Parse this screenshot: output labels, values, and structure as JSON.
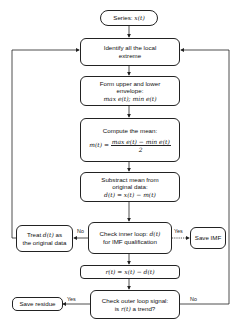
{
  "diagram": {
    "nodes": {
      "series": {
        "label": "Series: ",
        "math": "x(t)"
      },
      "identify": {
        "line1": "Identify all the local",
        "line2": "extreme"
      },
      "envelope": {
        "line1": "Form upper and lower",
        "line2": "envelope:",
        "math": "max e(t);  min e(t)"
      },
      "mean": {
        "line1": "Compute the mean:",
        "lhs": "m(t) =",
        "numerator": "max e(t) − min e(t)",
        "denominator": "2"
      },
      "subtract": {
        "line1": "Substract mean from",
        "line2": "original data:",
        "math": "d(t) = x(t) − m(t)"
      },
      "inner_check": {
        "line1_text": "Check inner loop: ",
        "line1_math": "d(t)",
        "line2": "for IMF qualification"
      },
      "treat": {
        "line1_text": "Treat ",
        "line1_math": "d(t)",
        "line1_suffix": " as",
        "line2": "the original data"
      },
      "save_imf": {
        "label": "Save IMF"
      },
      "residual": {
        "math": "r(t) = x(t) − d(t)"
      },
      "outer_check": {
        "line1": "Check outer loop signal:",
        "line2_text": "is ",
        "line2_math": "r(t)",
        "line2_suffix": "  a trend?"
      },
      "save_residue": {
        "label": "Save residue"
      }
    },
    "edge_labels": {
      "inner_no": "No",
      "inner_yes": "Yes",
      "outer_yes": "Yes",
      "outer_no": "No"
    },
    "colors": {
      "stroke": "#222222",
      "background": "#ffffff",
      "text": "#111111"
    }
  }
}
